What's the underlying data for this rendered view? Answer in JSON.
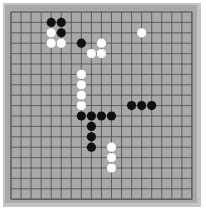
{
  "board": {
    "size": 19,
    "origin_x": 11,
    "origin_y": 12,
    "spacing_x": 10.05,
    "spacing_y": 10.4,
    "colors": {
      "frame": "#c4c4c4",
      "surface": "#a9a9a9",
      "line": "#4a4a4a",
      "black_stone": "#111111",
      "white_stone": "#ffffff"
    }
  },
  "stones": [
    {
      "color": "black",
      "col": 4,
      "row": 1
    },
    {
      "color": "black",
      "col": 5,
      "row": 1
    },
    {
      "color": "white",
      "col": 4,
      "row": 2
    },
    {
      "color": "black",
      "col": 5,
      "row": 2
    },
    {
      "color": "white",
      "col": 4,
      "row": 3
    },
    {
      "color": "white",
      "col": 5,
      "row": 3
    },
    {
      "color": "black",
      "col": 7,
      "row": 3
    },
    {
      "color": "white",
      "col": 9,
      "row": 3
    },
    {
      "color": "white",
      "col": 8,
      "row": 4
    },
    {
      "color": "white",
      "col": 9,
      "row": 4
    },
    {
      "color": "white",
      "col": 13,
      "row": 2
    },
    {
      "color": "white",
      "col": 7,
      "row": 6
    },
    {
      "color": "white",
      "col": 7,
      "row": 7
    },
    {
      "color": "white",
      "col": 7,
      "row": 8
    },
    {
      "color": "white",
      "col": 7,
      "row": 9
    },
    {
      "color": "black",
      "col": 12,
      "row": 9
    },
    {
      "color": "black",
      "col": 13,
      "row": 9
    },
    {
      "color": "black",
      "col": 14,
      "row": 9
    },
    {
      "color": "black",
      "col": 7,
      "row": 10
    },
    {
      "color": "black",
      "col": 8,
      "row": 10
    },
    {
      "color": "black",
      "col": 9,
      "row": 10
    },
    {
      "color": "black",
      "col": 10,
      "row": 10
    },
    {
      "color": "black",
      "col": 8,
      "row": 11
    },
    {
      "color": "black",
      "col": 8,
      "row": 12
    },
    {
      "color": "black",
      "col": 8,
      "row": 13
    },
    {
      "color": "white",
      "col": 10,
      "row": 13
    },
    {
      "color": "white",
      "col": 10,
      "row": 14
    },
    {
      "color": "white",
      "col": 10,
      "row": 15
    }
  ]
}
